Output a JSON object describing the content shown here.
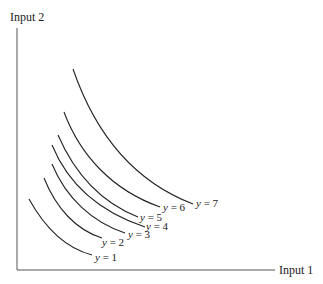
{
  "diagram": {
    "type": "isoquant-map",
    "y_axis_label": "Input 2",
    "x_axis_label": "Input 1",
    "curves": [
      {
        "label_var": "y",
        "label_eq": " = 1",
        "path": "M29,199 C45,228 65,248 92,255",
        "label_x": 95,
        "label_y": 261
      },
      {
        "label_var": "y",
        "label_eq": " = 2",
        "path": "M44,178 C56,208 76,230 102,238",
        "label_x": 102,
        "label_y": 246
      },
      {
        "label_var": "y",
        "label_eq": " = 3",
        "path": "M52,164 C66,198 92,222 125,233",
        "label_x": 128,
        "label_y": 238
      },
      {
        "label_var": "y",
        "label_eq": " = 4",
        "path": "M52,145 C68,184 100,212 145,227",
        "label_x": 146,
        "label_y": 230
      },
      {
        "label_var": "y",
        "label_eq": " = 5",
        "path": "M58,135 C74,172 100,202 138,217",
        "label_x": 140,
        "label_y": 221
      },
      {
        "label_var": "y",
        "label_eq": " = 6",
        "path": "M64,112 C80,155 112,190 160,207",
        "label_x": 163,
        "label_y": 211
      },
      {
        "label_var": "y",
        "label_eq": " = 7",
        "path": "M73,69 C94,130 130,180 193,204",
        "label_x": 196,
        "label_y": 207
      }
    ]
  }
}
